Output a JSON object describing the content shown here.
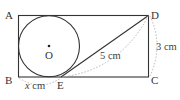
{
  "figure": {
    "points": {
      "A": "A",
      "B": "B",
      "C": "C",
      "D": "D",
      "E": "E",
      "O": "O"
    },
    "measurements": {
      "DE": "5 cm",
      "DC": "3 cm",
      "BE_var": "x",
      "BE_unit": " cm"
    },
    "colors": {
      "stroke": "#333333",
      "dashed": "#aaaaaa",
      "text": "#333333"
    }
  }
}
